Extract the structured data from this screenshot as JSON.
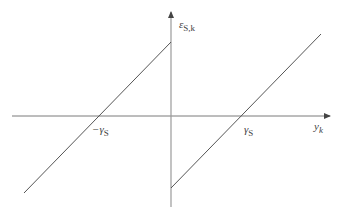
{
  "diagram": {
    "y_axis_label": {
      "main": "ε",
      "sub": "S,k"
    },
    "x_axis_label": {
      "main": "y",
      "sub": "k"
    },
    "neg_tick_label": {
      "main": "−γ",
      "sub": "S"
    },
    "pos_tick_label": {
      "main": "γ",
      "sub": "S"
    },
    "colors": {
      "axis": "#7a7a7a",
      "line": "#555555"
    }
  }
}
